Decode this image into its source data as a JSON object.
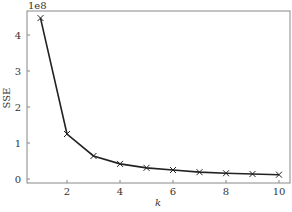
{
  "chart_data": {
    "type": "line",
    "title": "",
    "xlabel": "k",
    "ylabel": "SSE",
    "y_offset_label": "1e8",
    "x": [
      1,
      2,
      3,
      4,
      5,
      6,
      7,
      8,
      9,
      10
    ],
    "series": [
      {
        "name": "SSE",
        "marker": "x",
        "color": "#222222",
        "values": [
          447000000.0,
          125000000.0,
          64000000.0,
          42000000.0,
          31000000.0,
          25000000.0,
          19000000.0,
          16000000.0,
          14000000.0,
          12000000.0
        ]
      }
    ],
    "xticks": [
      2,
      4,
      6,
      8,
      10
    ],
    "yticks": [
      0,
      1,
      2,
      3,
      4
    ],
    "xlim": [
      0.5,
      10.4
    ],
    "ylim": [
      -10000000.0,
      465000000.0
    ],
    "grid": false,
    "legend": null
  },
  "labels": {
    "x_axis": "k",
    "y_axis": "SSE",
    "offset": "1e8",
    "xtick_labels": [
      "2",
      "4",
      "6",
      "8",
      "10"
    ],
    "ytick_labels": [
      "0",
      "1",
      "2",
      "3",
      "4"
    ]
  }
}
